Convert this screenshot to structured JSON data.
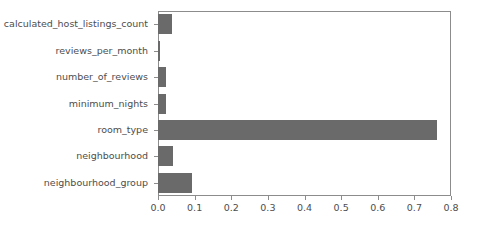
{
  "chart_data": {
    "type": "bar",
    "orientation": "horizontal",
    "title": "",
    "xlabel": "",
    "ylabel": "",
    "categories": [
      "neighbourhood_group",
      "neighbourhood",
      "room_type",
      "minimum_nights",
      "number_of_reviews",
      "reviews_per_month",
      "calculated_host_listings_count"
    ],
    "values": [
      0.092,
      0.04,
      0.762,
      0.022,
      0.022,
      0.005,
      0.038
    ],
    "xlim": [
      0.0,
      0.8
    ],
    "xticks": [
      0.0,
      0.1,
      0.2,
      0.3,
      0.4,
      0.5,
      0.6,
      0.7,
      0.8
    ],
    "xtick_labels": [
      "0.0",
      "0.1",
      "0.2",
      "0.3",
      "0.4",
      "0.5",
      "0.6",
      "0.7",
      "0.8"
    ],
    "grid": false,
    "legend": null,
    "bar_color": "#6a6a6a",
    "axis_color": "#8c8c8c",
    "tick_text_color": "#4d4d4d",
    "background_color": "#ffffff"
  }
}
